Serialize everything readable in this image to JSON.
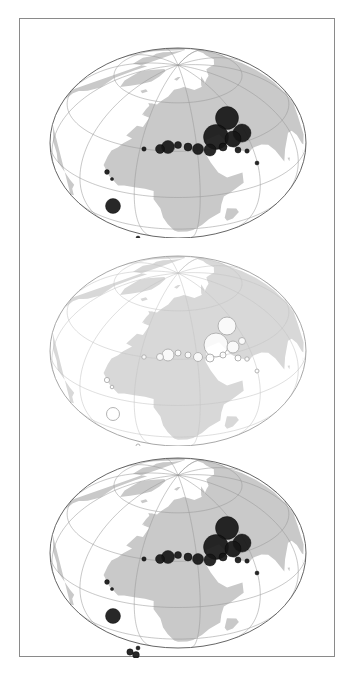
{
  "figure": {
    "title": "",
    "panel_count": 3,
    "frame": {
      "x": 19,
      "y": 18,
      "width": 316,
      "height": 639,
      "stroke": "#8a8a8a"
    },
    "background": "#ffffff"
  },
  "style": {
    "land_fill": "#c9c9c9",
    "land_fill_light": "#d8d8d8",
    "graticule_stroke": "#9a9a9a",
    "graticule_stroke_light": "#c4c4c4",
    "globe_outline": "#555555",
    "globe_outline_light": "#9e9e9e",
    "symbol_filled": "#161616",
    "symbol_hollow_stroke": "#b3b3b3",
    "symbol_hollow_fill": "#ffffff"
  },
  "projection": {
    "type": "oblique-orthographic",
    "graticule_interval_deg": 30,
    "center_lon": 20,
    "center_lat": 35
  },
  "chart_data": {
    "type": "scatter",
    "title": "",
    "subtitle": "",
    "xlabel": "Longitude",
    "ylabel": "Latitude",
    "xlim": [
      -180,
      180
    ],
    "ylim": [
      -90,
      90
    ],
    "grid": true,
    "legend": "",
    "panels": [
      {
        "id": "panel-top",
        "label": "",
        "symbol_style": "filled",
        "cx": 158,
        "cy": 110,
        "rx": 128,
        "ry": 95,
        "points": [
          {
            "x": 207,
            "y": 85,
            "r": 11.5
          },
          {
            "x": 222,
            "y": 100,
            "r": 9.0
          },
          {
            "x": 196,
            "y": 104,
            "r": 12.5
          },
          {
            "x": 213,
            "y": 106,
            "r": 8.0
          },
          {
            "x": 218,
            "y": 117,
            "r": 3.0
          },
          {
            "x": 203,
            "y": 114,
            "r": 4.0
          },
          {
            "x": 178,
            "y": 116,
            "r": 5.5
          },
          {
            "x": 190,
            "y": 117,
            "r": 6.0
          },
          {
            "x": 168,
            "y": 114,
            "r": 4.0
          },
          {
            "x": 158,
            "y": 112,
            "r": 3.5
          },
          {
            "x": 148,
            "y": 114,
            "r": 6.5
          },
          {
            "x": 140,
            "y": 116,
            "r": 4.5
          },
          {
            "x": 124,
            "y": 116,
            "r": 2.2
          },
          {
            "x": 237,
            "y": 130,
            "r": 2.0
          },
          {
            "x": 227,
            "y": 118,
            "r": 2.2
          },
          {
            "x": 87,
            "y": 139,
            "r": 2.4
          },
          {
            "x": 92,
            "y": 146,
            "r": 1.6
          },
          {
            "x": 93,
            "y": 173,
            "r": 7.5
          },
          {
            "x": 110,
            "y": 209,
            "r": 3.2
          },
          {
            "x": 116,
            "y": 212,
            "r": 3.4
          },
          {
            "x": 118,
            "y": 205,
            "r": 2.0
          }
        ]
      },
      {
        "id": "panel-middle",
        "label": "",
        "symbol_style": "hollow",
        "cx": 158,
        "cy": 110,
        "rx": 128,
        "ry": 95,
        "points": [
          {
            "x": 207,
            "y": 85,
            "r": 9.0
          },
          {
            "x": 222,
            "y": 100,
            "r": 3.5
          },
          {
            "x": 196,
            "y": 104,
            "r": 12.0
          },
          {
            "x": 213,
            "y": 106,
            "r": 6.0
          },
          {
            "x": 218,
            "y": 117,
            "r": 3.0
          },
          {
            "x": 203,
            "y": 114,
            "r": 3.0
          },
          {
            "x": 178,
            "y": 116,
            "r": 4.5
          },
          {
            "x": 190,
            "y": 117,
            "r": 4.0
          },
          {
            "x": 168,
            "y": 114,
            "r": 3.0
          },
          {
            "x": 158,
            "y": 112,
            "r": 3.0
          },
          {
            "x": 148,
            "y": 114,
            "r": 6.0
          },
          {
            "x": 140,
            "y": 116,
            "r": 3.5
          },
          {
            "x": 124,
            "y": 116,
            "r": 2.2
          },
          {
            "x": 237,
            "y": 130,
            "r": 2.0
          },
          {
            "x": 227,
            "y": 118,
            "r": 2.2
          },
          {
            "x": 87,
            "y": 139,
            "r": 2.6
          },
          {
            "x": 92,
            "y": 146,
            "r": 1.8
          },
          {
            "x": 93,
            "y": 173,
            "r": 6.5
          },
          {
            "x": 110,
            "y": 209,
            "r": 3.0
          },
          {
            "x": 116,
            "y": 212,
            "r": 3.2
          },
          {
            "x": 118,
            "y": 205,
            "r": 2.0
          }
        ]
      },
      {
        "id": "panel-bottom",
        "label": "",
        "symbol_style": "filled",
        "cx": 158,
        "cy": 110,
        "rx": 128,
        "ry": 95,
        "points": [
          {
            "x": 207,
            "y": 85,
            "r": 11.5
          },
          {
            "x": 222,
            "y": 100,
            "r": 9.0
          },
          {
            "x": 196,
            "y": 104,
            "r": 12.5
          },
          {
            "x": 213,
            "y": 106,
            "r": 8.0
          },
          {
            "x": 218,
            "y": 117,
            "r": 3.0
          },
          {
            "x": 203,
            "y": 114,
            "r": 4.0
          },
          {
            "x": 178,
            "y": 116,
            "r": 5.5
          },
          {
            "x": 190,
            "y": 117,
            "r": 6.0
          },
          {
            "x": 168,
            "y": 114,
            "r": 4.0
          },
          {
            "x": 158,
            "y": 112,
            "r": 3.5
          },
          {
            "x": 148,
            "y": 114,
            "r": 6.5
          },
          {
            "x": 140,
            "y": 116,
            "r": 4.5
          },
          {
            "x": 124,
            "y": 116,
            "r": 2.2
          },
          {
            "x": 237,
            "y": 130,
            "r": 2.0
          },
          {
            "x": 227,
            "y": 118,
            "r": 2.2
          },
          {
            "x": 87,
            "y": 139,
            "r": 2.4
          },
          {
            "x": 92,
            "y": 146,
            "r": 1.6
          },
          {
            "x": 93,
            "y": 173,
            "r": 7.5
          },
          {
            "x": 110,
            "y": 209,
            "r": 3.2
          },
          {
            "x": 116,
            "y": 212,
            "r": 3.4
          },
          {
            "x": 118,
            "y": 205,
            "r": 2.0
          }
        ]
      }
    ]
  }
}
